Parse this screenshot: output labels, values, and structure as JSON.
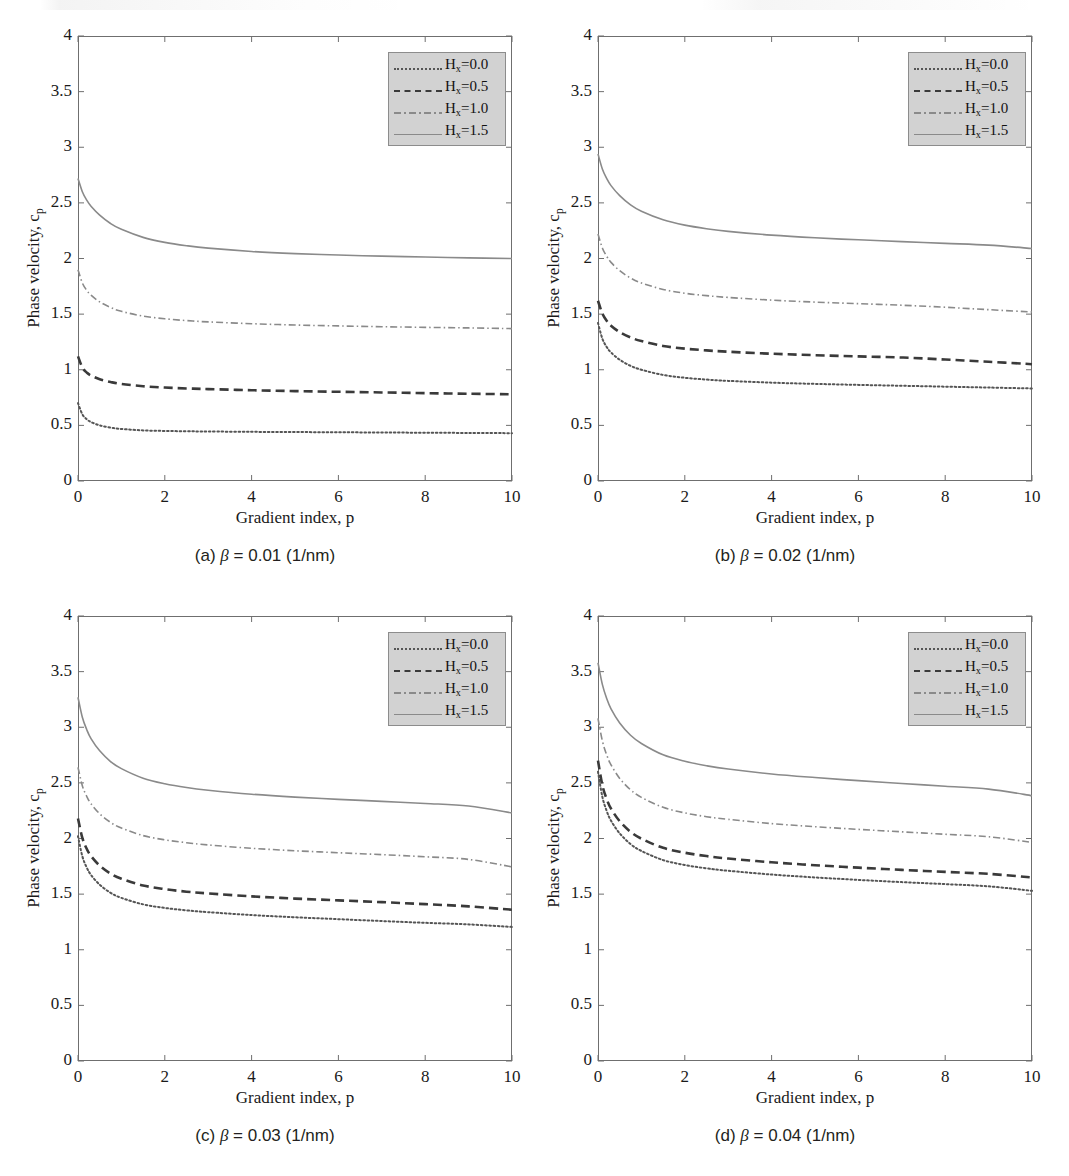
{
  "figure": {
    "axis_labels": {
      "x": "Gradient index, p",
      "y_prefix": "Phase velocity, c",
      "y_sub": "p"
    },
    "legend": {
      "entries": [
        {
          "label_prefix": "H",
          "label_sub": "x",
          "label_value": "=0.0",
          "style": "dotted",
          "color": "#555555"
        },
        {
          "label_prefix": "H",
          "label_sub": "x",
          "label_value": "=0.5",
          "style": "dashed",
          "color": "#3a3a3a"
        },
        {
          "label_prefix": "H",
          "label_sub": "x",
          "label_value": "=1.0",
          "style": "dashdot",
          "color": "#8a8a8a"
        },
        {
          "label_prefix": "H",
          "label_sub": "x",
          "label_value": "=1.5",
          "style": "solid",
          "color": "#8a8a8a"
        }
      ],
      "background_color": "#d2d2d2",
      "border_color": "#8c8c8c"
    },
    "panels": [
      {
        "id": "a",
        "caption_index": "(a)",
        "caption_symbol": "β",
        "caption_rest": "= 0.01 (1/nm)"
      },
      {
        "id": "b",
        "caption_index": "(b)",
        "caption_symbol": "β",
        "caption_rest": "= 0.02 (1/nm)"
      },
      {
        "id": "c",
        "caption_index": "(c)",
        "caption_symbol": "β",
        "caption_rest": "= 0.03 (1/nm)"
      },
      {
        "id": "d",
        "caption_index": "(d)",
        "caption_symbol": "β",
        "caption_rest": "= 0.04 (1/nm)"
      }
    ]
  },
  "chart_data": [
    {
      "type": "line",
      "panel": "a",
      "title": "(a) β = 0.01 (1/nm)",
      "xlabel": "Gradient index, p",
      "ylabel": "Phase velocity, c_p",
      "xlim": [
        0,
        10
      ],
      "ylim": [
        0,
        4
      ],
      "xticks": [
        0,
        2,
        4,
        6,
        8,
        10
      ],
      "yticks": [
        0,
        0.5,
        1,
        1.5,
        2,
        2.5,
        3,
        3.5,
        4
      ],
      "grid": false,
      "legend_position": "upper right",
      "x": [
        0,
        0.1,
        0.2,
        0.3,
        0.5,
        0.75,
        1,
        1.5,
        2,
        2.5,
        3,
        4,
        5,
        6,
        7,
        8,
        9,
        10
      ],
      "series": [
        {
          "name": "H_x =0.0",
          "style": "dotted",
          "color": "#555555",
          "values": [
            0.7,
            0.6,
            0.555,
            0.53,
            0.5,
            0.48,
            0.468,
            0.455,
            0.45,
            0.447,
            0.445,
            0.442,
            0.44,
            0.438,
            0.436,
            0.434,
            0.432,
            0.43
          ]
        },
        {
          "name": "H_x =0.5",
          "style": "dashed",
          "color": "#3a3a3a",
          "values": [
            1.12,
            1.02,
            0.975,
            0.948,
            0.915,
            0.89,
            0.872,
            0.852,
            0.84,
            0.832,
            0.826,
            0.816,
            0.808,
            0.802,
            0.796,
            0.79,
            0.784,
            0.78
          ]
        },
        {
          "name": "H_x =1.0",
          "style": "dashdot",
          "color": "#8a8a8a",
          "values": [
            1.9,
            1.78,
            1.715,
            1.67,
            1.61,
            1.56,
            1.525,
            1.482,
            1.458,
            1.442,
            1.43,
            1.414,
            1.402,
            1.394,
            1.387,
            1.381,
            1.376,
            1.37
          ]
        },
        {
          "name": "H_x =1.5",
          "style": "solid",
          "color": "#8a8a8a",
          "values": [
            2.72,
            2.6,
            2.525,
            2.47,
            2.39,
            2.315,
            2.262,
            2.19,
            2.145,
            2.115,
            2.093,
            2.063,
            2.044,
            2.031,
            2.021,
            2.013,
            2.006,
            2.0
          ]
        }
      ]
    },
    {
      "type": "line",
      "panel": "b",
      "title": "(b) β = 0.02 (1/nm)",
      "xlabel": "Gradient index, p",
      "ylabel": "Phase velocity, c_p",
      "xlim": [
        0,
        10
      ],
      "ylim": [
        0,
        4
      ],
      "xticks": [
        0,
        2,
        4,
        6,
        8,
        10
      ],
      "yticks": [
        0,
        0.5,
        1,
        1.5,
        2,
        2.5,
        3,
        3.5,
        4
      ],
      "grid": false,
      "legend_position": "upper right",
      "x": [
        0,
        0.1,
        0.2,
        0.3,
        0.5,
        0.75,
        1,
        1.5,
        2,
        2.5,
        3,
        4,
        5,
        6,
        7,
        8,
        9,
        10
      ],
      "series": [
        {
          "name": "H_x =0.0",
          "style": "dotted",
          "color": "#555555",
          "values": [
            1.42,
            1.28,
            1.205,
            1.155,
            1.09,
            1.035,
            1.0,
            0.953,
            0.928,
            0.912,
            0.9,
            0.884,
            0.873,
            0.864,
            0.856,
            0.848,
            0.84,
            0.832
          ]
        },
        {
          "name": "H_x =0.5",
          "style": "dashed",
          "color": "#3a3a3a",
          "values": [
            1.62,
            1.505,
            1.44,
            1.396,
            1.338,
            1.29,
            1.258,
            1.214,
            1.19,
            1.174,
            1.162,
            1.144,
            1.131,
            1.12,
            1.11,
            1.092,
            1.072,
            1.05
          ]
        },
        {
          "name": "H_x =1.0",
          "style": "dashdot",
          "color": "#8a8a8a",
          "values": [
            2.22,
            2.095,
            2.02,
            1.965,
            1.89,
            1.825,
            1.78,
            1.722,
            1.688,
            1.666,
            1.65,
            1.626,
            1.608,
            1.594,
            1.58,
            1.562,
            1.54,
            1.52
          ]
        },
        {
          "name": "H_x =1.5",
          "style": "solid",
          "color": "#8a8a8a",
          "values": [
            2.94,
            2.805,
            2.72,
            2.655,
            2.565,
            2.482,
            2.425,
            2.348,
            2.3,
            2.268,
            2.244,
            2.21,
            2.186,
            2.168,
            2.152,
            2.136,
            2.12,
            2.09
          ]
        }
      ]
    },
    {
      "type": "line",
      "panel": "c",
      "title": "(c) β = 0.03 (1/nm)",
      "xlabel": "Gradient index, p",
      "ylabel": "Phase velocity, c_p",
      "xlim": [
        0,
        10
      ],
      "ylim": [
        0,
        4
      ],
      "xticks": [
        0,
        2,
        4,
        6,
        8,
        10
      ],
      "yticks": [
        0,
        0.5,
        1,
        1.5,
        2,
        2.5,
        3,
        3.5,
        4
      ],
      "grid": false,
      "legend_position": "upper right",
      "x": [
        0,
        0.1,
        0.2,
        0.3,
        0.5,
        0.75,
        1,
        1.5,
        2,
        2.5,
        3,
        4,
        5,
        6,
        7,
        8,
        9,
        10
      ],
      "series": [
        {
          "name": "H_x =0.0",
          "style": "dotted",
          "color": "#555555",
          "values": [
            2.02,
            1.84,
            1.74,
            1.672,
            1.585,
            1.512,
            1.466,
            1.408,
            1.376,
            1.354,
            1.338,
            1.312,
            1.292,
            1.275,
            1.258,
            1.242,
            1.228,
            1.205
          ]
        },
        {
          "name": "H_x =0.5",
          "style": "dashed",
          "color": "#3a3a3a",
          "values": [
            2.18,
            2.005,
            1.908,
            1.842,
            1.756,
            1.684,
            1.638,
            1.578,
            1.545,
            1.522,
            1.506,
            1.48,
            1.46,
            1.444,
            1.428,
            1.41,
            1.39,
            1.36
          ]
        },
        {
          "name": "H_x =1.0",
          "style": "dashdot",
          "color": "#8a8a8a",
          "values": [
            2.64,
            2.475,
            2.38,
            2.312,
            2.222,
            2.145,
            2.094,
            2.026,
            1.988,
            1.962,
            1.942,
            1.912,
            1.89,
            1.872,
            1.855,
            1.836,
            1.812,
            1.745
          ]
        },
        {
          "name": "H_x =1.5",
          "style": "solid",
          "color": "#8a8a8a",
          "values": [
            3.27,
            3.09,
            2.98,
            2.898,
            2.788,
            2.692,
            2.628,
            2.542,
            2.492,
            2.458,
            2.434,
            2.398,
            2.372,
            2.352,
            2.334,
            2.315,
            2.292,
            2.23
          ]
        }
      ]
    },
    {
      "type": "line",
      "panel": "d",
      "title": "(d) β = 0.04 (1/nm)",
      "xlabel": "Gradient index, p",
      "ylabel": "Phase velocity, c_p",
      "xlim": [
        0,
        10
      ],
      "ylim": [
        0,
        4
      ],
      "xticks": [
        0,
        2,
        4,
        6,
        8,
        10
      ],
      "yticks": [
        0,
        0.5,
        1,
        1.5,
        2,
        2.5,
        3,
        3.5,
        4
      ],
      "grid": false,
      "legend_position": "upper right",
      "x": [
        0,
        0.1,
        0.2,
        0.3,
        0.5,
        0.75,
        1,
        1.5,
        2,
        2.5,
        3,
        4,
        5,
        6,
        7,
        8,
        9,
        10
      ],
      "series": [
        {
          "name": "H_x =0.0",
          "style": "dotted",
          "color": "#555555",
          "values": [
            2.6,
            2.375,
            2.248,
            2.16,
            2.046,
            1.95,
            1.888,
            1.806,
            1.762,
            1.732,
            1.71,
            1.676,
            1.65,
            1.628,
            1.608,
            1.59,
            1.57,
            1.53
          ]
        },
        {
          "name": "H_x =0.5",
          "style": "dashed",
          "color": "#3a3a3a",
          "values": [
            2.7,
            2.48,
            2.355,
            2.268,
            2.155,
            2.06,
            1.998,
            1.916,
            1.872,
            1.842,
            1.82,
            1.786,
            1.76,
            1.738,
            1.718,
            1.7,
            1.682,
            1.65
          ]
        },
        {
          "name": "H_x =1.0",
          "style": "dashdot",
          "color": "#8a8a8a",
          "values": [
            3.08,
            2.878,
            2.752,
            2.662,
            2.54,
            2.438,
            2.37,
            2.28,
            2.23,
            2.196,
            2.172,
            2.134,
            2.106,
            2.082,
            2.06,
            2.038,
            2.016,
            1.965
          ]
        },
        {
          "name": "H_x =1.5",
          "style": "solid",
          "color": "#8a8a8a",
          "values": [
            3.58,
            3.385,
            3.258,
            3.165,
            3.038,
            2.928,
            2.854,
            2.752,
            2.694,
            2.654,
            2.624,
            2.58,
            2.548,
            2.52,
            2.494,
            2.47,
            2.444,
            2.385
          ]
        }
      ]
    }
  ]
}
